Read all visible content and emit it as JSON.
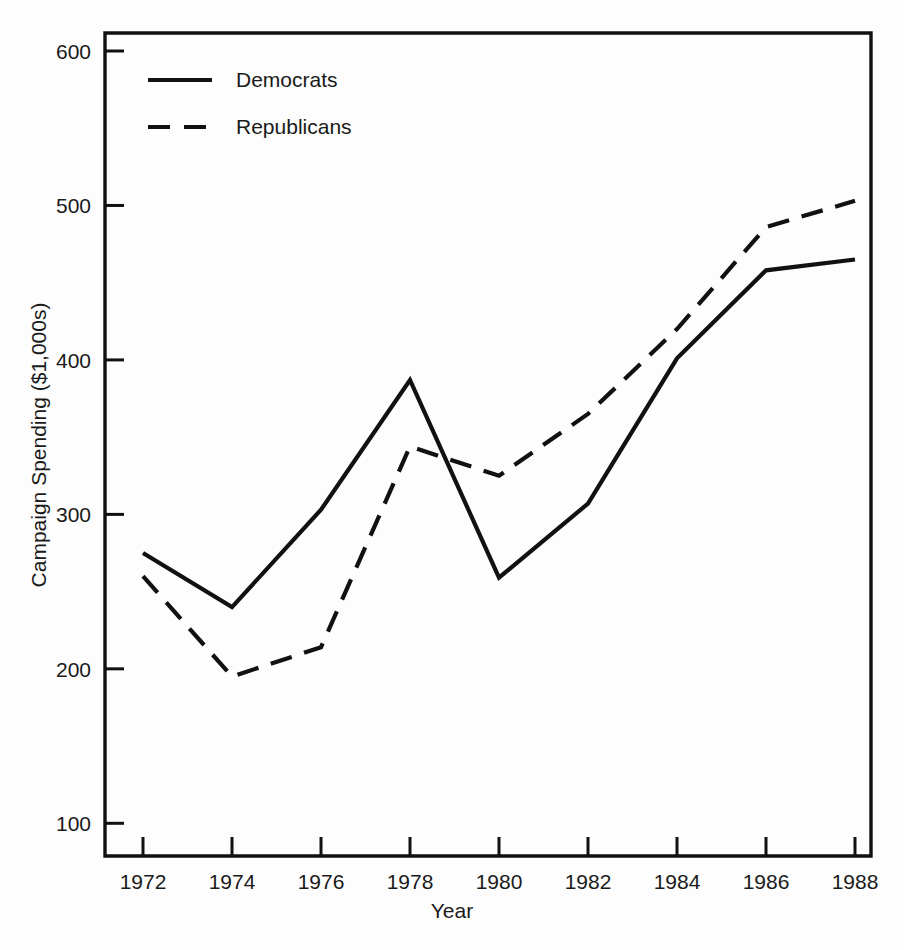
{
  "chart_data": {
    "type": "line",
    "title": "",
    "subtitle": "",
    "xlabel": "Year",
    "ylabel": "Campaign Spending ($1,000s)",
    "x": [
      1972,
      1974,
      1976,
      1978,
      1980,
      1982,
      1984,
      1986,
      1988
    ],
    "xtick_labels": [
      "1972",
      "1974",
      "1976",
      "1978",
      "1980",
      "1982",
      "1984",
      "1986",
      "1988"
    ],
    "ytick_labels": [
      "100",
      "200",
      "300",
      "400",
      "500",
      "600"
    ],
    "yticks": [
      100,
      200,
      300,
      400,
      500,
      600
    ],
    "xlim": [
      1971,
      1989
    ],
    "ylim": [
      62,
      625
    ],
    "grid": false,
    "legend_position": "top-left",
    "series": [
      {
        "name": "Democrats",
        "style": "solid",
        "color": "#111111",
        "values": [
          275,
          240,
          303,
          387,
          259,
          307,
          401,
          458,
          465
        ]
      },
      {
        "name": "Republicans",
        "style": "dashed",
        "color": "#111111",
        "values": [
          260,
          195,
          214,
          344,
          325,
          365,
          420,
          486,
          503
        ]
      }
    ]
  },
  "legend": {
    "entries": [
      {
        "label": "Democrats",
        "style": "solid"
      },
      {
        "label": "Republicans",
        "style": "dashed"
      }
    ]
  },
  "axes": {
    "x_title": "Year",
    "y_title": "Campaign Spending ($1,000s)"
  },
  "colors": {
    "ink": "#111111",
    "background": "#fdfdfd"
  }
}
